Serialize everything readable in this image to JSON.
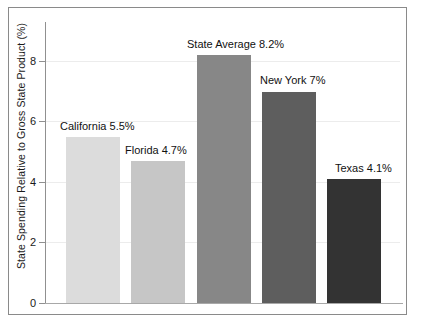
{
  "chart_data": {
    "type": "bar",
    "title": "",
    "xlabel": "",
    "ylabel": "State Spending Relative to Gross State Product (%)",
    "ylim": [
      0,
      9.3
    ],
    "yticks": [
      0,
      2,
      4,
      6,
      8
    ],
    "ytick_labels": [
      "0",
      "2",
      "4",
      "6",
      "8"
    ],
    "grid": true,
    "legend": "none",
    "categories": [
      "California",
      "Florida",
      "State Average",
      "New York",
      "Texas"
    ],
    "values": [
      5.5,
      4.7,
      8.2,
      7.0,
      4.1
    ],
    "bar_colors": [
      "#dcdcdc",
      "#c6c6c6",
      "#878787",
      "#5e5e5e",
      "#333333"
    ],
    "data_labels": [
      "California 5.5%",
      "Florida 4.7%",
      "State Average 8.2%",
      "New York 7%",
      "Texas 4.1%"
    ],
    "annotations": [
      {
        "label": "California 5.5%",
        "value": 5.5,
        "color": "#dcdcdc"
      },
      {
        "label": "Florida 4.7%",
        "value": 4.7,
        "color": "#c6c6c6"
      },
      {
        "label": "State Average 8.2%",
        "value": 8.2,
        "color": "#878787"
      },
      {
        "label": "New York 7%",
        "value": 7.0,
        "color": "#5e5e5e"
      },
      {
        "label": "Texas 4.1%",
        "value": 4.1,
        "color": "#333333"
      }
    ]
  },
  "axis": {
    "tick_0": "0",
    "tick_2": "2",
    "tick_4": "4",
    "tick_6": "6",
    "tick_8": "8",
    "y_title": "State Spending Relative to Gross State Product (%)"
  },
  "labels": {
    "bar_0": "California 5.5%",
    "bar_1": "Florida 4.7%",
    "bar_2": "State Average 8.2%",
    "bar_3": "New York 7%",
    "bar_4": "Texas 4.1%"
  }
}
